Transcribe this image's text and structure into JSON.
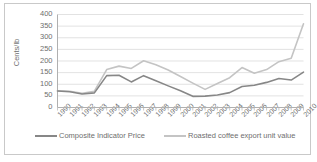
{
  "chart_data": {
    "type": "line",
    "title": "",
    "xlabel": "",
    "ylabel": "Cents/lb",
    "ylim": [
      0,
      400
    ],
    "ytick_step": 50,
    "yticks": [
      "400",
      "350",
      "300",
      "250",
      "200",
      "150",
      "100",
      "50",
      "0"
    ],
    "grid": true,
    "legend_position": "bottom",
    "categories": [
      "1990",
      "1991",
      "1992",
      "1993",
      "1994",
      "1995",
      "1996",
      "1997",
      "1998",
      "1999",
      "2000",
      "2001",
      "2002",
      "2003",
      "2004",
      "2005",
      "2006",
      "2007",
      "2008",
      "2009",
      "2010"
    ],
    "series": [
      {
        "name": "Composite Indicator Price",
        "color": "#878787",
        "values": [
          71,
          68,
          58,
          63,
          137,
          139,
          110,
          137,
          115,
          93,
          72,
          48,
          49,
          54,
          64,
          90,
          96,
          108,
          125,
          118,
          152
        ]
      },
      {
        "name": "Roasted coffee export unit value",
        "color": "#c4c4c4",
        "values": [
          72,
          70,
          61,
          70,
          163,
          178,
          168,
          201,
          184,
          161,
          133,
          105,
          78,
          103,
          128,
          172,
          147,
          163,
          197,
          212,
          360
        ]
      }
    ]
  },
  "legend": {
    "items": [
      {
        "label": "Composite Indicator Price"
      },
      {
        "label": "Roasted coffee export unit value"
      }
    ]
  },
  "axis": {
    "y_title": "Cents/lb"
  },
  "colors": {
    "series_dark": "#878787",
    "series_light": "#c4c4c4",
    "gridline": "#d6d6d6",
    "axis": "#b0b0b0",
    "text": "#6e6e6e",
    "frame": "#c9c9c9",
    "background": "#ffffff"
  }
}
